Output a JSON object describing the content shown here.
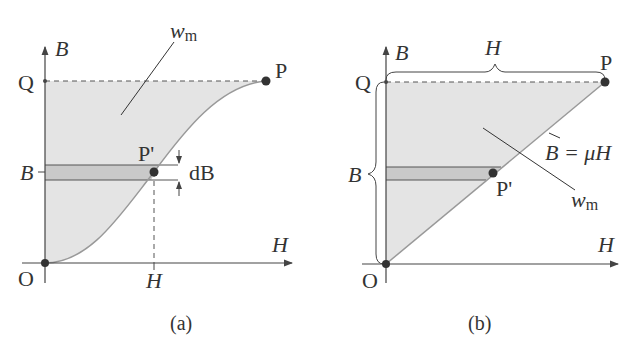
{
  "figure": {
    "panel_a": {
      "caption": "(a)",
      "y_axis_label": "B",
      "x_axis_label": "H",
      "origin_label": "O",
      "q_label": "Q",
      "p_label": "P",
      "p_prime_label": "P'",
      "b_tick_label": "B",
      "h_tick_label": "H",
      "db_label": "dB",
      "area_label_main": "w",
      "area_label_sub": "m"
    },
    "panel_b": {
      "caption": "(b)",
      "y_axis_label": "B",
      "x_axis_label": "H",
      "origin_label": "O",
      "q_label": "Q",
      "p_label": "P",
      "p_prime_label": "P'",
      "brace_h_label": "H",
      "brace_b_label": "B",
      "line_label": "B = μH",
      "area_label_main": "w",
      "area_label_sub": "m"
    },
    "colors": {
      "fill": "#e2e2e2",
      "strip": "#c8c8c8",
      "curve": "#9a9a9a",
      "ink": "#333333"
    }
  }
}
